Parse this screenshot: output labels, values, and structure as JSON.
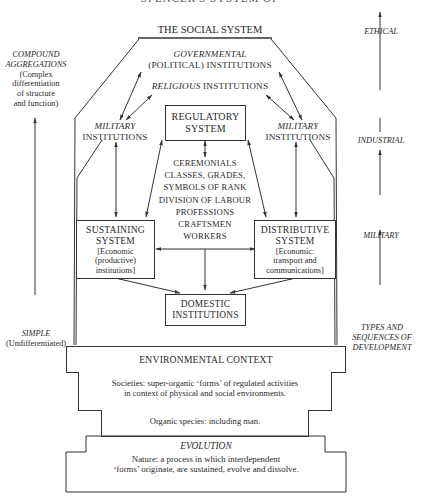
{
  "header": {
    "clipped_title": "SPENCER'S SYSTEM OF ANALYSIS"
  },
  "diagram": {
    "title": "THE SOCIAL SYSTEM",
    "left_axis": {
      "top_label_italic": "COMPOUND AGGREGATIONS",
      "top_label_lines": [
        "COMPOUND",
        "AGGREGATIONS"
      ],
      "top_sub_lines": [
        "(Complex",
        "differentiation",
        "of structure",
        "and function)"
      ],
      "bottom_label_italic": "SIMPLE",
      "bottom_sub": "(Undifferentiated)"
    },
    "right_axis": {
      "labels": [
        "ETHICAL",
        "INDUSTRIAL",
        "MILITARY"
      ],
      "bottom_lines": [
        "TYPES AND",
        "SEQUENCES OF",
        "DEVELOPMENT"
      ]
    },
    "nodes": {
      "governmental_italic": "GOVERNMENTAL",
      "governmental_sub": "(POLITICAL) INSTITUTIONS",
      "religious_italic": "RELIGIOUS",
      "religious_rest": "INSTITUTIONS",
      "military_left_italic": "MILITARY",
      "military_left_sub": "INSTITUTIONS",
      "military_right_italic": "MILITARY",
      "military_right_sub": "INSTITUTIONS",
      "regulatory_lines": [
        "REGULATORY",
        "SYSTEM"
      ],
      "center_list": [
        "CEREMONIALS",
        "CLASSES, GRADES,",
        "SYMBOLS OF RANK",
        "DIVISION OF LABOUR",
        "PROFESSIONS",
        "CRAFTSMEN",
        "WORKERS"
      ],
      "sustaining_lines": [
        "SUSTAINING",
        "SYSTEM"
      ],
      "sustaining_sub": [
        "[Economic",
        "(productive)",
        "institutions]"
      ],
      "distributive_lines": [
        "DISTRIBUTIVE",
        "SYSTEM"
      ],
      "distributive_sub": [
        "[Economic:",
        "transport and",
        "communications]"
      ],
      "domestic_lines": [
        "DOMESTIC",
        "INSTITUTIONS"
      ]
    },
    "foundation": {
      "environmental": "ENVIRONMENTAL CONTEXT",
      "societies_lines": [
        "Societies: super-organic ‘forms’ of regulated activities",
        "in context of physical and social environments."
      ],
      "organic": "Organic species: including man.",
      "evolution_title": "EVOLUTION",
      "evolution_lines": [
        "Nature: a process in which interdependent",
        "‘forms’ originate, are sustained, evolve and dissolve."
      ]
    },
    "colors": {
      "ink": "#2a2a2a",
      "line": "#333333",
      "background": "#ffffff"
    }
  }
}
